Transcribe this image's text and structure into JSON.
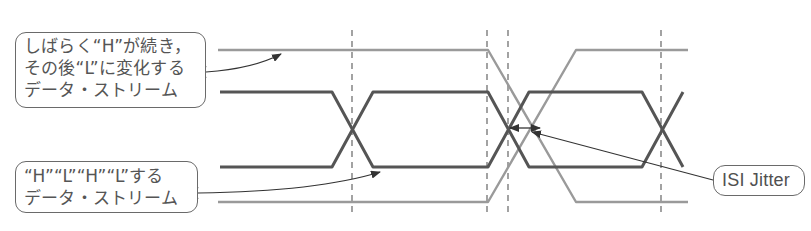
{
  "diagram": {
    "colors": {
      "background": "#ffffff",
      "gray_stream": "#9a9a9a",
      "dark_stream": "#555555",
      "dashed_marker": "#666666",
      "callout_border": "#6a6a6a",
      "callout_text": "#555555"
    },
    "callouts": {
      "top": {
        "lines": [
          "しばらく“H”が続き，",
          "その後“L”に変化する",
          "データ・ストリーム"
        ],
        "points_to": "gray_stream"
      },
      "bottom": {
        "lines": [
          "“H”“L”“H”“L”する",
          "データ・ストリーム"
        ],
        "points_to": "dark_stream"
      },
      "isi": {
        "label": "ISI Jitter",
        "points_to": "crossing_offset"
      }
    },
    "streams": [
      {
        "name": "gray_stream",
        "description": "Long H then transitions to L (and complement)",
        "line_style": "solid",
        "width": 2.4
      },
      {
        "name": "dark_stream",
        "description": "Alternating H/L data stream (eye pattern)",
        "line_style": "solid",
        "width": 3
      }
    ],
    "markers": {
      "dashed_vertical_x": [
        352,
        487,
        508,
        661
      ]
    }
  }
}
